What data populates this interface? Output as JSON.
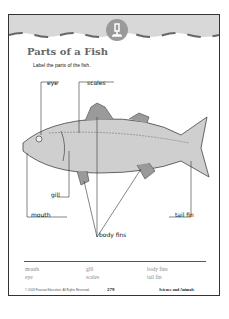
{
  "header": {
    "title": "Parts of a Fish",
    "instruction": "Label the parts of the fish.",
    "badge_icon": "microscope-icon"
  },
  "diagram": {
    "labels": {
      "eye": "eye",
      "scales": "scales",
      "gill": "gill",
      "mouth": "mouth",
      "tail_fin": "tail fin",
      "body_fins": "body fins"
    }
  },
  "word_bank": {
    "row1": [
      "mouth",
      "gill",
      "body fins"
    ],
    "row2": [
      "eye",
      "scales",
      "tail fin"
    ]
  },
  "footer": {
    "copyright": "© 2003 Pearson Education. All Rights Reserved.",
    "page_number": "279",
    "subject": "Science and Animals"
  }
}
